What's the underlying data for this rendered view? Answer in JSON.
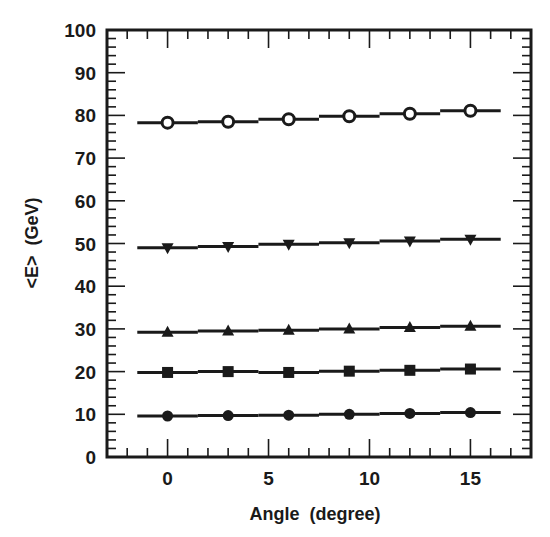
{
  "chart_data": {
    "type": "scatter",
    "title": "",
    "xlabel": "Angle  (degree)",
    "ylabel": "<E>  (GeV)",
    "xlim": [
      -3,
      18
    ],
    "ylim": [
      0,
      100
    ],
    "xticks": [
      0,
      5,
      10,
      15
    ],
    "xtick_labels": [
      "0",
      "5",
      "10",
      "15"
    ],
    "x_minor_step": 1,
    "yticks": [
      0,
      10,
      20,
      30,
      40,
      50,
      60,
      70,
      80,
      90,
      100
    ],
    "ytick_labels": [
      "0",
      "10",
      "20",
      "30",
      "40",
      "50",
      "60",
      "70",
      "80",
      "90",
      "100"
    ],
    "y_minor_step": 2,
    "grid": false,
    "legend": null,
    "x": [
      0,
      3,
      6,
      9,
      12,
      15
    ],
    "x_error": 1.5,
    "series": [
      {
        "name": "open-circle",
        "marker": "open-circle",
        "values": [
          78.3,
          78.5,
          79.1,
          79.8,
          80.4,
          81.1
        ]
      },
      {
        "name": "down-triangle",
        "marker": "down-triangle",
        "values": [
          49.0,
          49.3,
          49.8,
          50.2,
          50.6,
          51.0
        ]
      },
      {
        "name": "up-triangle",
        "marker": "up-triangle",
        "values": [
          29.2,
          29.5,
          29.7,
          30.0,
          30.3,
          30.6
        ]
      },
      {
        "name": "square",
        "marker": "filled-square",
        "values": [
          19.8,
          20.0,
          19.8,
          20.1,
          20.3,
          20.6
        ]
      },
      {
        "name": "filled-circle",
        "marker": "filled-circle",
        "values": [
          9.6,
          9.7,
          9.8,
          10.0,
          10.2,
          10.4
        ]
      }
    ]
  },
  "colors": {
    "ink": "#1a1a1a",
    "background": "#ffffff"
  }
}
